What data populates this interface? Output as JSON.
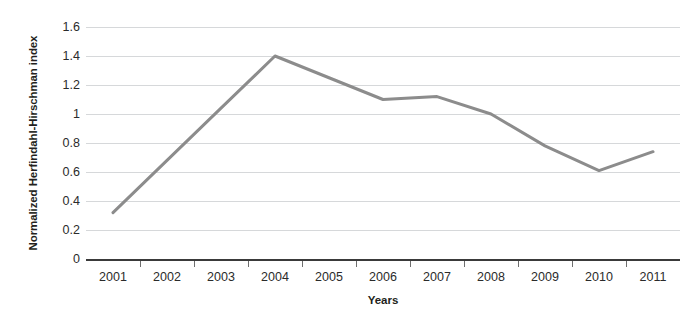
{
  "chart_data": {
    "type": "line",
    "title": "",
    "xlabel": "Years",
    "ylabel": "Normalized Herfindahl-Hirschman index",
    "categories": [
      "2001",
      "2002",
      "2003",
      "2004",
      "2005",
      "2006",
      "2007",
      "2008",
      "2009",
      "2010",
      "2011"
    ],
    "values": [
      0.32,
      0.68,
      1.04,
      1.4,
      1.25,
      1.1,
      1.12,
      1.0,
      0.78,
      0.61,
      0.74
    ],
    "series": [
      {
        "name": "Normalized Herfindahl-Hirschman index",
        "values": [
          0.32,
          0.68,
          1.04,
          1.4,
          1.25,
          1.1,
          1.12,
          1.0,
          0.78,
          0.61,
          0.74
        ],
        "color": "#8c8c8c"
      }
    ],
    "ylim": [
      0,
      1.6
    ],
    "ytick_labels": [
      "0",
      "0.2",
      "0.4",
      "0.6",
      "0.8",
      "1",
      "1.2",
      "1.4",
      "1.6"
    ],
    "ytick_values": [
      0,
      0.2,
      0.4,
      0.6,
      0.8,
      1,
      1.2,
      1.4,
      1.6
    ],
    "grid": true,
    "grid_axis": "y",
    "legend": false,
    "legend_position": "none",
    "markers": false,
    "line_width": 3,
    "background_color": "#ffffff",
    "grid_color": "#d6d8da",
    "axis_color": "#3a3a3a"
  }
}
